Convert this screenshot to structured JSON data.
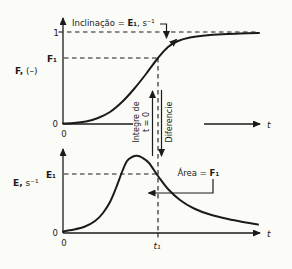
{
  "figure": {
    "colors": {
      "background": "#fbfbf8",
      "ink": "#1b1b1b"
    },
    "top_plot": {
      "y_axis_var": "F,",
      "y_axis_unit": " (–)",
      "y_tick_one": "1",
      "y_tick_f1": "F₁",
      "origin_y": "0",
      "origin_x": "0",
      "x_axis_label": "t",
      "slope_note": {
        "prefix": "Inclinação = ",
        "var": "E₁",
        "suffix": ", s⁻¹"
      }
    },
    "middle": {
      "integrate_line1": "Integre de",
      "integrate_line2": "t = 0",
      "differentiate": "Diferencie"
    },
    "bottom_plot": {
      "y_axis_var": "E,",
      "y_axis_unit": " s⁻¹",
      "y_tick_e1": "E₁",
      "origin_y": "0",
      "origin_x": "0",
      "x_axis_label": "t",
      "x_tick_t1": "t₁",
      "area_note": {
        "prefix": "Área = ",
        "var": "F₁"
      }
    },
    "curves": {
      "F": [
        [
          63,
          123.5
        ],
        [
          74,
          123
        ],
        [
          86,
          121.5
        ],
        [
          98,
          118
        ],
        [
          110,
          112
        ],
        [
          122,
          102
        ],
        [
          134,
          89
        ],
        [
          146,
          74
        ],
        [
          158,
          58
        ],
        [
          168,
          47
        ],
        [
          178,
          41
        ],
        [
          190,
          37.5
        ],
        [
          205,
          35.5
        ],
        [
          222,
          34.3
        ],
        [
          240,
          33.5
        ],
        [
          259,
          33
        ]
      ],
      "E": [
        [
          63,
          231.5
        ],
        [
          74,
          229.5
        ],
        [
          85,
          226.5
        ],
        [
          95,
          221
        ],
        [
          103,
          213
        ],
        [
          110,
          202
        ],
        [
          116,
          188
        ],
        [
          122,
          172
        ],
        [
          127,
          161
        ],
        [
          132,
          157
        ],
        [
          137,
          155.8
        ],
        [
          142,
          157.5
        ],
        [
          149,
          163
        ],
        [
          158,
          176
        ],
        [
          168,
          189
        ],
        [
          180,
          200
        ],
        [
          194,
          208.5
        ],
        [
          210,
          214.5
        ],
        [
          228,
          219
        ],
        [
          243,
          222
        ],
        [
          258,
          224.5
        ]
      ]
    }
  }
}
